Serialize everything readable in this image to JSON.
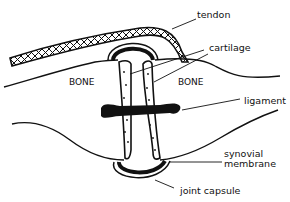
{
  "diagram": {
    "labels": {
      "tendon": "tendon",
      "cartilage": "cartilage",
      "bone_left": "BONE",
      "bone_right": "BONE",
      "ligament": "ligament",
      "synovial_line1": "synovial",
      "synovial_line2": "membrane",
      "joint_capsule": "joint capsule"
    },
    "colors": {
      "ink": "#111111",
      "background": "#ffffff"
    }
  }
}
